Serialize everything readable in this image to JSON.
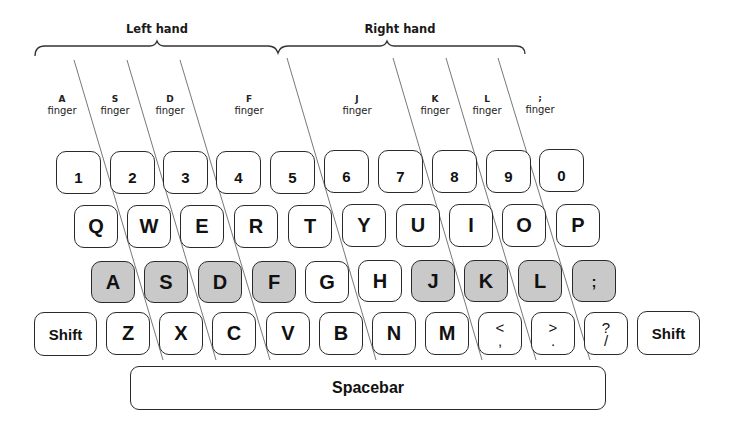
{
  "hands": {
    "left": {
      "label": "Left hand"
    },
    "right": {
      "label": "Right hand"
    }
  },
  "fingers": [
    {
      "key": "A",
      "word": "finger"
    },
    {
      "key": "S",
      "word": "finger"
    },
    {
      "key": "D",
      "word": "finger"
    },
    {
      "key": "F",
      "word": "finger"
    },
    {
      "key": "J",
      "word": "finger"
    },
    {
      "key": "K",
      "word": "finger"
    },
    {
      "key": "L",
      "word": "finger"
    },
    {
      "key": ";",
      "word": "finger"
    }
  ],
  "rows": {
    "number": [
      "1",
      "2",
      "3",
      "4",
      "5",
      "6",
      "7",
      "8",
      "9",
      "0"
    ],
    "top": [
      "Q",
      "W",
      "E",
      "R",
      "T",
      "Y",
      "U",
      "I",
      "O",
      "P"
    ],
    "home": [
      "A",
      "S",
      "D",
      "F",
      "G",
      "H",
      "J",
      "K",
      "L",
      ";"
    ],
    "bottom": {
      "left_shift": "Shift",
      "letters": [
        "Z",
        "X",
        "C",
        "V",
        "B",
        "N",
        "M"
      ],
      "punct": [
        {
          "upper": "<",
          "lower": ","
        },
        {
          "upper": ">",
          "lower": "."
        },
        {
          "upper": "?",
          "lower": "/"
        }
      ],
      "right_shift": "Shift"
    },
    "spacebar": "Spacebar"
  },
  "home_keys_highlighted": [
    "A",
    "S",
    "D",
    "F",
    "J",
    "K",
    "L",
    ";"
  ],
  "colors": {
    "home_key_fill": "#c9c9c9",
    "key_fill": "#ffffff",
    "outline": "#2a2a2a"
  }
}
